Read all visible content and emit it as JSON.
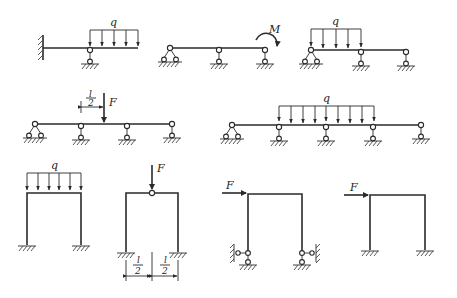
{
  "figure": {
    "colors": {
      "line": "#2a2a2a",
      "background": "#ffffff"
    },
    "diagrams": [
      {
        "id": "a",
        "type": "propped-cantilever-beam",
        "load_label": "q",
        "load": "uniformly distributed load"
      },
      {
        "id": "b",
        "type": "two-span-continuous-beam",
        "load_label": "M",
        "load": "end moment"
      },
      {
        "id": "c",
        "type": "two-span-continuous-beam",
        "load_label": "q",
        "load": "uniformly distributed load on first span"
      },
      {
        "id": "d",
        "type": "three-span-continuous-beam",
        "load_label": "F",
        "dimension_num": "l",
        "dimension_den": "2",
        "load": "point load at mid-span"
      },
      {
        "id": "e",
        "type": "four-span-continuous-beam",
        "load_label": "q",
        "load": "uniformly distributed load on middle spans"
      },
      {
        "id": "f",
        "type": "fixed-portal-frame",
        "load_label": "q",
        "load": "uniformly distributed load on beam"
      },
      {
        "id": "g",
        "type": "fixed-portal-frame-with-hinge",
        "load_label": "F",
        "dim_left_num": "l",
        "dim_left_den": "2",
        "dim_right_num": "l",
        "dim_right_den": "2"
      },
      {
        "id": "h",
        "type": "portal-frame-pinned-with-lateral-supports",
        "load_label": "F",
        "load": "horizontal point load"
      },
      {
        "id": "i",
        "type": "fixed-portal-frame",
        "load_label": "F",
        "load": "horizontal point load"
      }
    ]
  }
}
